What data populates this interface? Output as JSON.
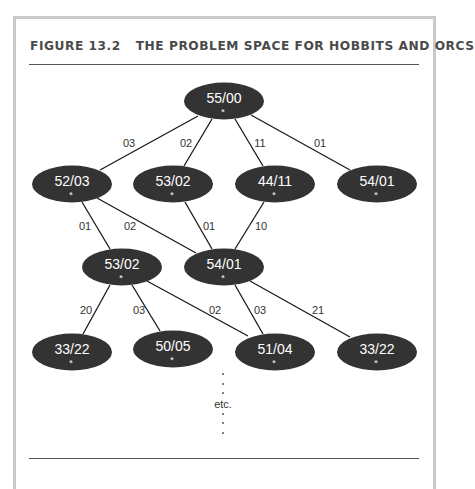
{
  "figure": {
    "number": "FIGURE 13.2",
    "title": "THE PROBLEM SPACE FOR HOBBITS AND ORCS",
    "colors": {
      "node_fill": "#333333",
      "node_text": "#ffffff",
      "edge": "#1a1a1a",
      "frame_border": "#c9c9c9",
      "title_text": "#4a4a4a"
    }
  },
  "nodes": [
    {
      "id": "n0",
      "label": "55/00",
      "mark": "*",
      "cx": 224,
      "cy": 101
    },
    {
      "id": "n1",
      "label": "52/03",
      "mark": "*",
      "cx": 72,
      "cy": 184
    },
    {
      "id": "n2",
      "label": "53/02",
      "mark": "*",
      "cx": 173,
      "cy": 184
    },
    {
      "id": "n3",
      "label": "44/11",
      "mark": "*",
      "cx": 275,
      "cy": 184
    },
    {
      "id": "n4",
      "label": "54/01",
      "mark": "*",
      "cx": 377,
      "cy": 184
    },
    {
      "id": "n5",
      "label": "53/02",
      "mark": "*",
      "cx": 122,
      "cy": 267
    },
    {
      "id": "n6",
      "label": "54/01",
      "mark": "*",
      "cx": 224,
      "cy": 267
    },
    {
      "id": "n7",
      "label": "33/22",
      "mark": "*",
      "cx": 72,
      "cy": 352
    },
    {
      "id": "n8",
      "label": "50/05",
      "mark": "*",
      "cx": 173,
      "cy": 349
    },
    {
      "id": "n9",
      "label": "51/04",
      "mark": "*",
      "cx": 275,
      "cy": 352
    },
    {
      "id": "n10",
      "label": "33/22",
      "mark": "*",
      "cx": 377,
      "cy": 352
    }
  ],
  "edges": [
    {
      "from": "n0",
      "to": "n1",
      "label": "03",
      "x1": 198,
      "y1": 116,
      "x2": 100,
      "y2": 170,
      "lx": 129,
      "ly": 147
    },
    {
      "from": "n0",
      "to": "n2",
      "label": "02",
      "x1": 212,
      "y1": 119,
      "x2": 184,
      "y2": 166,
      "lx": 186,
      "ly": 147
    },
    {
      "from": "n0",
      "to": "n3",
      "label": "11",
      "x1": 235,
      "y1": 119,
      "x2": 263,
      "y2": 166,
      "lx": 260,
      "ly": 147
    },
    {
      "from": "n0",
      "to": "n4",
      "label": "01",
      "x1": 251,
      "y1": 115,
      "x2": 350,
      "y2": 170,
      "lx": 320,
      "ly": 147
    },
    {
      "from": "n1",
      "to": "n5",
      "label": "01",
      "x1": 82,
      "y1": 202,
      "x2": 110,
      "y2": 249,
      "lx": 85,
      "ly": 230
    },
    {
      "from": "n1",
      "to": "n6",
      "label": "02",
      "x1": 97,
      "y1": 198,
      "x2": 196,
      "y2": 253,
      "lx": 130,
      "ly": 230
    },
    {
      "from": "n2",
      "to": "n6",
      "label": "01",
      "x1": 185,
      "y1": 202,
      "x2": 212,
      "y2": 249,
      "lx": 209,
      "ly": 230
    },
    {
      "from": "n3",
      "to": "n6",
      "label": "10",
      "x1": 264,
      "y1": 202,
      "x2": 235,
      "y2": 249,
      "lx": 261,
      "ly": 230
    },
    {
      "from": "n5",
      "to": "n7",
      "label": "20",
      "x1": 110,
      "y1": 285,
      "x2": 83,
      "y2": 334,
      "lx": 86,
      "ly": 314
    },
    {
      "from": "n5",
      "to": "n8",
      "label": "03",
      "x1": 132,
      "y1": 285,
      "x2": 160,
      "y2": 331,
      "lx": 139,
      "ly": 314
    },
    {
      "from": "n5",
      "to": "n9",
      "label": "02",
      "x1": 147,
      "y1": 281,
      "x2": 248,
      "y2": 336,
      "lx": 215,
      "ly": 314
    },
    {
      "from": "n6",
      "to": "n9",
      "label": "03",
      "x1": 235,
      "y1": 285,
      "x2": 263,
      "y2": 334,
      "lx": 260,
      "ly": 314
    },
    {
      "from": "n6",
      "to": "n10",
      "label": "21",
      "x1": 250,
      "y1": 281,
      "x2": 350,
      "y2": 337,
      "lx": 318,
      "ly": 314
    }
  ],
  "continuation": {
    "text": "etc.",
    "dots_above": [
      374,
      384,
      393
    ],
    "text_y": 408,
    "dots_below": [
      414,
      423,
      433
    ],
    "x": 223
  }
}
